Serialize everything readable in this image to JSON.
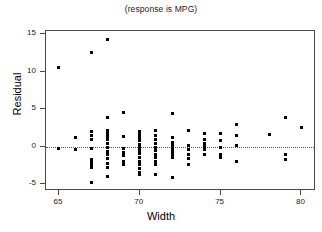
{
  "chart_data": {
    "type": "scatter",
    "title": "(response is MPG)",
    "xlabel": "Width",
    "ylabel": "Residual",
    "xlim": [
      64.2,
      80.9
    ],
    "ylim": [
      -5.9,
      15.4
    ],
    "xticks": [
      65,
      70,
      75,
      80
    ],
    "yticks": [
      -5,
      0,
      5,
      10,
      15
    ],
    "grid": false,
    "legend": null,
    "reference_line": {
      "y": 0,
      "style": "dotted",
      "color": "#555555"
    },
    "marker": {
      "shape": "square",
      "size_px": 3,
      "color": "#000000"
    },
    "series": [
      {
        "name": "Residuals vs Width",
        "points": [
          [
            65.0,
            10.6
          ],
          [
            65.0,
            -0.2
          ],
          [
            66.0,
            1.2
          ],
          [
            66.0,
            -0.4
          ],
          [
            67.0,
            12.6
          ],
          [
            67.0,
            2.0
          ],
          [
            67.0,
            1.5
          ],
          [
            67.0,
            1.0
          ],
          [
            67.0,
            -0.3
          ],
          [
            67.0,
            -1.7
          ],
          [
            67.0,
            -2.1
          ],
          [
            67.0,
            -2.4
          ],
          [
            67.0,
            -2.8
          ],
          [
            67.0,
            -4.8
          ],
          [
            68.0,
            14.3
          ],
          [
            68.0,
            3.9
          ],
          [
            68.0,
            2.1
          ],
          [
            68.0,
            1.8
          ],
          [
            68.0,
            1.4
          ],
          [
            68.0,
            0.9
          ],
          [
            68.0,
            0.4
          ],
          [
            68.0,
            -0.1
          ],
          [
            68.0,
            -0.6
          ],
          [
            68.0,
            -1.1
          ],
          [
            68.0,
            -1.6
          ],
          [
            68.0,
            -2.2
          ],
          [
            68.0,
            -2.7
          ],
          [
            68.0,
            -3.9
          ],
          [
            69.0,
            4.5
          ],
          [
            69.0,
            1.3
          ],
          [
            69.0,
            -0.3
          ],
          [
            69.0,
            -0.8
          ],
          [
            69.0,
            -1.2
          ],
          [
            69.0,
            -1.9
          ],
          [
            69.0,
            -2.4
          ],
          [
            70.0,
            2.0
          ],
          [
            70.0,
            1.6
          ],
          [
            70.0,
            1.2
          ],
          [
            70.0,
            0.8
          ],
          [
            70.0,
            0.3
          ],
          [
            70.0,
            -0.1
          ],
          [
            70.0,
            -0.5
          ],
          [
            70.0,
            -0.9
          ],
          [
            70.0,
            -1.4
          ],
          [
            70.0,
            -1.9
          ],
          [
            70.0,
            -2.4
          ],
          [
            70.0,
            -2.9
          ],
          [
            70.0,
            -3.4
          ],
          [
            70.0,
            -3.7
          ],
          [
            71.0,
            2.1
          ],
          [
            71.0,
            1.5
          ],
          [
            71.0,
            1.0
          ],
          [
            71.0,
            0.4
          ],
          [
            71.0,
            -0.1
          ],
          [
            71.0,
            -0.5
          ],
          [
            71.0,
            -1.0
          ],
          [
            71.0,
            -1.5
          ],
          [
            71.0,
            -2.0
          ],
          [
            71.0,
            -2.4
          ],
          [
            71.0,
            -3.7
          ],
          [
            72.0,
            4.4
          ],
          [
            72.0,
            1.2
          ],
          [
            72.0,
            0.6
          ],
          [
            72.0,
            0.2
          ],
          [
            72.0,
            -0.2
          ],
          [
            72.0,
            -0.6
          ],
          [
            72.0,
            -1.0
          ],
          [
            72.0,
            -1.5
          ],
          [
            72.0,
            -4.1
          ],
          [
            73.0,
            2.2
          ],
          [
            73.0,
            0.1
          ],
          [
            73.0,
            -0.4
          ],
          [
            73.0,
            -1.0
          ],
          [
            73.0,
            -1.6
          ],
          [
            73.0,
            -2.3
          ],
          [
            74.0,
            1.7
          ],
          [
            74.0,
            0.9
          ],
          [
            74.0,
            0.4
          ],
          [
            74.0,
            0.0
          ],
          [
            74.0,
            -0.4
          ],
          [
            74.0,
            -1.0
          ],
          [
            75.0,
            1.8
          ],
          [
            75.0,
            0.8
          ],
          [
            75.0,
            -0.1
          ],
          [
            75.0,
            -1.0
          ],
          [
            75.0,
            -1.4
          ],
          [
            76.0,
            3.0
          ],
          [
            76.0,
            1.5
          ],
          [
            76.0,
            0.2
          ],
          [
            76.0,
            -1.9
          ],
          [
            78.0,
            1.6
          ],
          [
            79.0,
            3.9
          ],
          [
            79.0,
            -1.0
          ],
          [
            79.0,
            -1.7
          ],
          [
            80.0,
            2.5
          ]
        ]
      }
    ]
  }
}
